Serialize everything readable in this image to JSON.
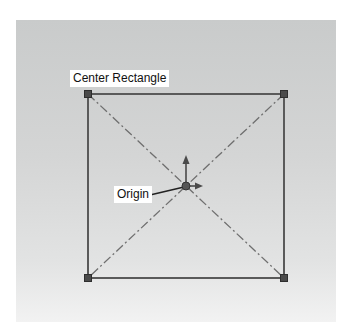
{
  "diagram": {
    "title_label": "Center Rectangle",
    "origin_label": "Origin",
    "rectangle": {
      "corners": [
        [
          88,
          94
        ],
        [
          284,
          94
        ],
        [
          284,
          278
        ],
        [
          88,
          278
        ]
      ],
      "center": [
        186,
        186
      ],
      "line_color": "#555555",
      "construction_line_color": "#6f6f6f"
    },
    "colors": {
      "panel_top": "#c9cbcb",
      "panel_bottom": "#f2f2f2",
      "handle_fill": "#4a4a4a",
      "axis_color": "#4a4a4a"
    }
  }
}
